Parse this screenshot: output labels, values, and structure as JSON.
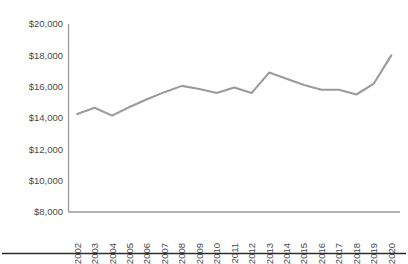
{
  "chart_data": {
    "type": "line",
    "title": "",
    "subtitle": "",
    "xlabel": "",
    "ylabel": "",
    "grid": false,
    "legend": "none",
    "xlim": [
      "2002",
      "2020"
    ],
    "ylim": [
      8000,
      20000
    ],
    "ytick_labels": [
      "$20,000",
      "$18,000",
      "$16,000",
      "$14,000",
      "$12,000",
      "$10,000",
      "$8,000"
    ],
    "ytick_values": [
      20000,
      18000,
      16000,
      14000,
      12000,
      10000,
      8000
    ],
    "categories": [
      "2002",
      "2003",
      "2004",
      "2005",
      "2006",
      "2007",
      "2008",
      "2009",
      "2010",
      "2011",
      "2012",
      "2013",
      "2014",
      "2015",
      "2016",
      "2017",
      "2018",
      "2019",
      "2020"
    ],
    "values": [
      14250,
      14650,
      14150,
      14700,
      15200,
      15650,
      16050,
      15850,
      15600,
      15950,
      15600,
      16900,
      16500,
      16100,
      15800,
      15800,
      15500,
      16200,
      18000
    ],
    "series": [
      {
        "name": "Value",
        "color": "#9b9b9b",
        "values": [
          14250,
          14650,
          14150,
          14700,
          15200,
          15650,
          16050,
          15850,
          15600,
          15950,
          15600,
          16900,
          16500,
          16100,
          15800,
          15800,
          15500,
          16200,
          18000
        ]
      }
    ]
  },
  "colors": {
    "line": "#9b9b9b",
    "axis": "#9a9a9a",
    "text": "#4a4a4a",
    "rule": "#2d2d2d",
    "background": "#ffffff"
  }
}
